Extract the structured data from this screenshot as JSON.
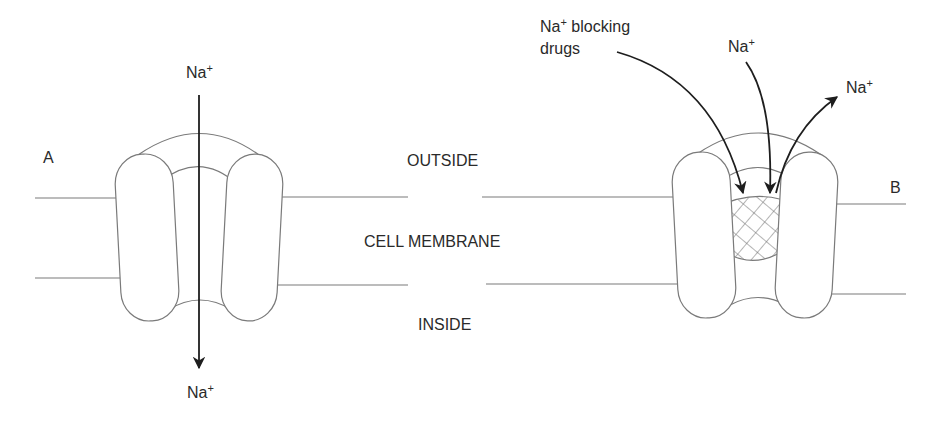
{
  "panel_a": {
    "label": "A",
    "ion_top": "Na",
    "ion_top_charge": "+",
    "ion_bottom": "Na",
    "ion_bottom_charge": "+"
  },
  "panel_b": {
    "label": "B",
    "drug_label_line1_prefix": "Na",
    "drug_label_charge": "+",
    "drug_label_line1_suffix": " blocking",
    "drug_label_line2": "drugs",
    "ion_in": "Na",
    "ion_in_charge": "+",
    "ion_out": "Na",
    "ion_out_charge": "+"
  },
  "regions": {
    "outside": "OUTSIDE",
    "membrane": "CELL MEMBRANE",
    "inside": "INSIDE"
  },
  "colors": {
    "line": "#7a7a7a",
    "arrow": "#1e1e1e",
    "text": "#2a2a2a"
  }
}
